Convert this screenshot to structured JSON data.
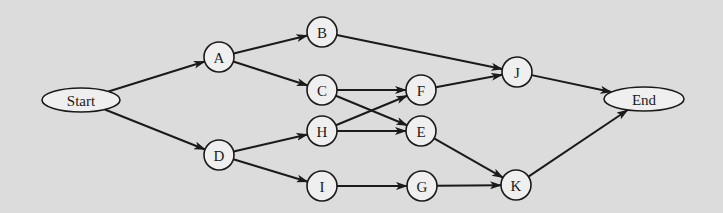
{
  "diagram": {
    "type": "network-flow",
    "colors": {
      "background": "#dcdcdc",
      "node_fill": "#efefef",
      "stroke": "#1a1a1a"
    },
    "nodes": [
      {
        "id": "Start",
        "label": "Start",
        "shape": "ellipse",
        "x": 81,
        "y": 100,
        "rx": 39,
        "ry": 12
      },
      {
        "id": "A",
        "label": "A",
        "shape": "circle",
        "x": 219,
        "y": 57,
        "r": 15
      },
      {
        "id": "D",
        "label": "D",
        "shape": "circle",
        "x": 219,
        "y": 155,
        "r": 15
      },
      {
        "id": "B",
        "label": "B",
        "shape": "circle",
        "x": 322,
        "y": 32,
        "r": 15
      },
      {
        "id": "C",
        "label": "C",
        "shape": "circle",
        "x": 322,
        "y": 90,
        "r": 15
      },
      {
        "id": "H",
        "label": "H",
        "shape": "circle",
        "x": 322,
        "y": 131,
        "r": 15
      },
      {
        "id": "I",
        "label": "I",
        "shape": "circle",
        "x": 322,
        "y": 186,
        "r": 15
      },
      {
        "id": "F",
        "label": "F",
        "shape": "circle",
        "x": 421,
        "y": 90,
        "r": 15
      },
      {
        "id": "E",
        "label": "E",
        "shape": "circle",
        "x": 421,
        "y": 131,
        "r": 15
      },
      {
        "id": "G",
        "label": "G",
        "shape": "circle",
        "x": 422,
        "y": 186,
        "r": 15
      },
      {
        "id": "J",
        "label": "J",
        "shape": "circle",
        "x": 517,
        "y": 72,
        "r": 15
      },
      {
        "id": "K",
        "label": "K",
        "shape": "circle",
        "x": 516,
        "y": 185,
        "r": 15
      },
      {
        "id": "End",
        "label": "End",
        "shape": "ellipse",
        "x": 644,
        "y": 99,
        "rx": 40,
        "ry": 12
      }
    ],
    "edges": [
      {
        "from": "Start",
        "to": "A"
      },
      {
        "from": "Start",
        "to": "D"
      },
      {
        "from": "A",
        "to": "B"
      },
      {
        "from": "A",
        "to": "C"
      },
      {
        "from": "D",
        "to": "H"
      },
      {
        "from": "D",
        "to": "I"
      },
      {
        "from": "B",
        "to": "J"
      },
      {
        "from": "C",
        "to": "F"
      },
      {
        "from": "C",
        "to": "E"
      },
      {
        "from": "H",
        "to": "F"
      },
      {
        "from": "H",
        "to": "E"
      },
      {
        "from": "I",
        "to": "G"
      },
      {
        "from": "F",
        "to": "J"
      },
      {
        "from": "E",
        "to": "K"
      },
      {
        "from": "G",
        "to": "K"
      },
      {
        "from": "J",
        "to": "End"
      },
      {
        "from": "K",
        "to": "End"
      }
    ]
  }
}
